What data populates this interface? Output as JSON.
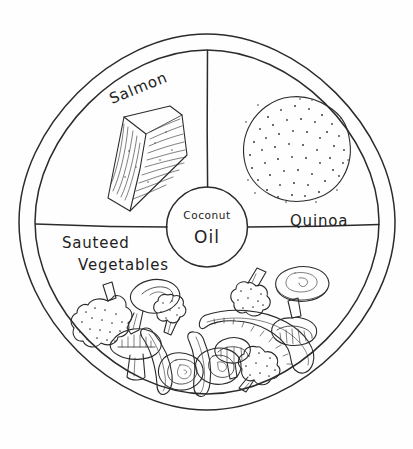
{
  "diagram": {
    "style": "hand-drawn line art",
    "background_color": "#ffffff",
    "ink_color": "#2b2b2b"
  },
  "plate": {
    "name": "plate",
    "center": {
      "x": 207,
      "y": 222
    },
    "outer_radius": 188,
    "inner_radius": 172,
    "hub_radius": 40,
    "hub_center": {
      "x": 207,
      "y": 227
    }
  },
  "sections": [
    {
      "id": "salmon",
      "label": "Salmon",
      "label_lines": [
        "Salmon"
      ],
      "label_rotation_deg": -22,
      "label_x": 112,
      "label_y": 104,
      "position": "top-left quadrant",
      "food_icon": "salmon-fillet-icon"
    },
    {
      "id": "quinoa",
      "label": "Quinoa",
      "label_lines": [
        "Quinoa"
      ],
      "label_rotation_deg": 0,
      "label_x": 290,
      "label_y": 226,
      "position": "top-right quadrant",
      "food_icon": "quinoa-pile-icon"
    },
    {
      "id": "sauteed-vegetables",
      "label": "Sauteed Vegetables",
      "label_lines": [
        "Sauteed",
        "Vegetables"
      ],
      "label_rotation_deg": 0,
      "label_x": 62,
      "label_y": 248,
      "position": "bottom half",
      "food_icon": "mixed-vegetables-icon"
    }
  ],
  "center_hub": {
    "id": "coconut-oil",
    "label_lines": [
      "Coconut",
      "Oil"
    ],
    "line1": "Coconut",
    "line2": "Oil",
    "center_x": 207,
    "center_y": 227
  },
  "vegetable_items": [
    {
      "name": "broccoli-floret",
      "count": 4
    },
    {
      "name": "mushroom-whole",
      "count": 1
    },
    {
      "name": "mushroom-slice",
      "count": 3
    },
    {
      "name": "mushroom-cap",
      "count": 1
    },
    {
      "name": "onion-ring",
      "count": 2
    },
    {
      "name": "pepper-strip",
      "count": 4
    }
  ]
}
